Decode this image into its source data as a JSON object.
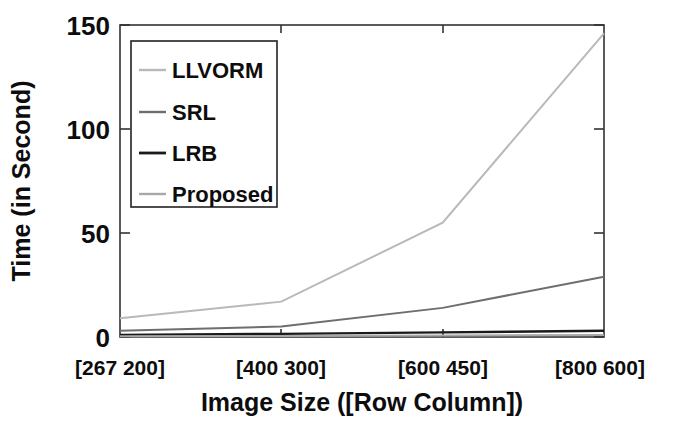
{
  "chart_data": {
    "type": "line",
    "title": "",
    "xlabel": "Image Size ([Row Column])",
    "ylabel": "Time (in Second)",
    "categories": [
      "[267 200]",
      "[400 300]",
      "[600 450]",
      "[800 600]"
    ],
    "ylim": [
      0,
      150
    ],
    "yticks": [
      0,
      50,
      100,
      150
    ],
    "ytick_labels": [
      "0",
      "50",
      "100",
      "150"
    ],
    "grid": false,
    "legend_position": "upper-left-inside",
    "series": [
      {
        "name": "LLVORM",
        "values": [
          9,
          17,
          55,
          146
        ],
        "color": "#b9b9b9",
        "width": 2.0
      },
      {
        "name": "SRL",
        "values": [
          3,
          5,
          14,
          29
        ],
        "color": "#6e6e6e",
        "width": 2.0
      },
      {
        "name": "LRB",
        "values": [
          1,
          1.5,
          2.2,
          3
        ],
        "color": "#1a1a1a",
        "width": 2.4
      },
      {
        "name": "Proposed",
        "values": [
          0.4,
          0.5,
          0.7,
          1.0
        ],
        "color": "#a8a8a8",
        "width": 2.0
      }
    ]
  },
  "axes": {
    "y_tick_0": "0",
    "y_tick_50": "50",
    "y_tick_100": "100",
    "y_tick_150": "150",
    "x_cat_0": "[267 200]",
    "x_cat_1": "[400 300]",
    "x_cat_2": "[600 450]",
    "x_cat_3": "[800 600]",
    "x_title": "Image Size ([Row Column])",
    "y_title": "Time (in Second)"
  },
  "legend": {
    "entries": [
      {
        "label": "LLVORM",
        "color": "#b9b9b9"
      },
      {
        "label": "SRL",
        "color": "#6e6e6e"
      },
      {
        "label": "LRB",
        "color": "#1a1a1a"
      },
      {
        "label": "Proposed",
        "color": "#a8a8a8"
      }
    ]
  }
}
